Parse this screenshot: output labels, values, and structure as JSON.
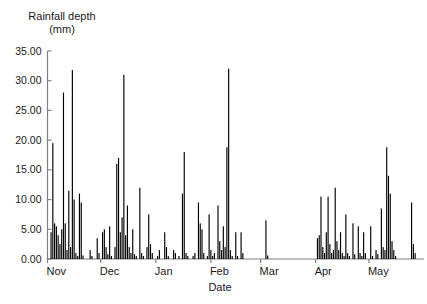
{
  "chart_data": {
    "type": "bar",
    "title": "",
    "ylabel": "Rainfall depth\n(mm)",
    "ylabel_line1": "Rainfall depth",
    "ylabel_line2": "(mm)",
    "xlabel": "Date",
    "ylim": [
      0,
      35
    ],
    "ytick_labels": [
      "0.00",
      "5.00",
      "10.00",
      "15.00",
      "20.00",
      "25.00",
      "30.00",
      "35.00"
    ],
    "ytick_values": [
      0,
      5,
      10,
      15,
      20,
      25,
      30,
      35
    ],
    "xtick_labels": [
      "Nov",
      "Dec",
      "Jan",
      "Feb",
      "Mar",
      "Apr",
      "May"
    ],
    "xtick_positions": [
      0,
      30,
      61,
      92,
      120,
      151,
      181
    ],
    "grid": false,
    "legend": null,
    "bar_color": "#000000",
    "axis_color": "#808080",
    "x_unit": "day",
    "x_range": [
      0,
      212
    ],
    "values": [
      {
        "x": 1,
        "v": 0.0
      },
      {
        "x": 2,
        "v": 4.5
      },
      {
        "x": 3,
        "v": 19.5
      },
      {
        "x": 4,
        "v": 6.0
      },
      {
        "x": 5,
        "v": 5.5
      },
      {
        "x": 6,
        "v": 4.0
      },
      {
        "x": 7,
        "v": 2.5
      },
      {
        "x": 8,
        "v": 5.0
      },
      {
        "x": 9,
        "v": 28.0
      },
      {
        "x": 10,
        "v": 6.0
      },
      {
        "x": 11,
        "v": 1.5
      },
      {
        "x": 12,
        "v": 11.5
      },
      {
        "x": 13,
        "v": 2.0
      },
      {
        "x": 14,
        "v": 31.8
      },
      {
        "x": 15,
        "v": 10.0
      },
      {
        "x": 16,
        "v": 1.0
      },
      {
        "x": 17,
        "v": 0.5
      },
      {
        "x": 18,
        "v": 11.0
      },
      {
        "x": 19,
        "v": 9.5
      },
      {
        "x": 20,
        "v": 0.6
      },
      {
        "x": 21,
        "v": 0.0
      },
      {
        "x": 22,
        "v": 0.0
      },
      {
        "x": 23,
        "v": 0.0
      },
      {
        "x": 24,
        "v": 1.5
      },
      {
        "x": 25,
        "v": 0.5
      },
      {
        "x": 26,
        "v": 0.0
      },
      {
        "x": 27,
        "v": 0.0
      },
      {
        "x": 28,
        "v": 3.5
      },
      {
        "x": 29,
        "v": 1.0
      },
      {
        "x": 30,
        "v": 0.0
      },
      {
        "x": 31,
        "v": 4.5
      },
      {
        "x": 32,
        "v": 5.0
      },
      {
        "x": 33,
        "v": 2.0
      },
      {
        "x": 34,
        "v": 0.8
      },
      {
        "x": 35,
        "v": 5.5
      },
      {
        "x": 36,
        "v": 0.5
      },
      {
        "x": 37,
        "v": 0.0
      },
      {
        "x": 38,
        "v": 2.0
      },
      {
        "x": 39,
        "v": 16.0
      },
      {
        "x": 40,
        "v": 17.0
      },
      {
        "x": 41,
        "v": 4.5
      },
      {
        "x": 42,
        "v": 7.0
      },
      {
        "x": 43,
        "v": 31.0
      },
      {
        "x": 44,
        "v": 4.0
      },
      {
        "x": 45,
        "v": 9.0
      },
      {
        "x": 46,
        "v": 2.0
      },
      {
        "x": 47,
        "v": 1.0
      },
      {
        "x": 48,
        "v": 5.0
      },
      {
        "x": 49,
        "v": 0.8
      },
      {
        "x": 50,
        "v": 0.5
      },
      {
        "x": 51,
        "v": 0.0
      },
      {
        "x": 52,
        "v": 12.0
      },
      {
        "x": 53,
        "v": 1.0
      },
      {
        "x": 54,
        "v": 0.5
      },
      {
        "x": 55,
        "v": 0.0
      },
      {
        "x": 56,
        "v": 2.0
      },
      {
        "x": 57,
        "v": 7.5
      },
      {
        "x": 58,
        "v": 2.5
      },
      {
        "x": 59,
        "v": 1.0
      },
      {
        "x": 60,
        "v": 0.0
      },
      {
        "x": 61,
        "v": 0.0
      },
      {
        "x": 62,
        "v": 0.5
      },
      {
        "x": 63,
        "v": 1.5
      },
      {
        "x": 64,
        "v": 0.0
      },
      {
        "x": 65,
        "v": 0.0
      },
      {
        "x": 66,
        "v": 4.5
      },
      {
        "x": 67,
        "v": 2.0
      },
      {
        "x": 68,
        "v": 0.5
      },
      {
        "x": 69,
        "v": 0.0
      },
      {
        "x": 70,
        "v": 0.0
      },
      {
        "x": 71,
        "v": 1.5
      },
      {
        "x": 72,
        "v": 1.0
      },
      {
        "x": 73,
        "v": 0.0
      },
      {
        "x": 74,
        "v": 0.5
      },
      {
        "x": 75,
        "v": 0.0
      },
      {
        "x": 76,
        "v": 11.0
      },
      {
        "x": 77,
        "v": 18.0
      },
      {
        "x": 78,
        "v": 1.0
      },
      {
        "x": 79,
        "v": 0.5
      },
      {
        "x": 80,
        "v": 0.0
      },
      {
        "x": 81,
        "v": 0.0
      },
      {
        "x": 82,
        "v": 0.5
      },
      {
        "x": 83,
        "v": 1.0
      },
      {
        "x": 84,
        "v": 0.0
      },
      {
        "x": 85,
        "v": 9.5
      },
      {
        "x": 86,
        "v": 6.0
      },
      {
        "x": 87,
        "v": 5.0
      },
      {
        "x": 88,
        "v": 1.0
      },
      {
        "x": 89,
        "v": 0.0
      },
      {
        "x": 90,
        "v": 0.5
      },
      {
        "x": 91,
        "v": 7.5
      },
      {
        "x": 92,
        "v": 1.5
      },
      {
        "x": 93,
        "v": 0.5
      },
      {
        "x": 94,
        "v": 1.0
      },
      {
        "x": 95,
        "v": 0.0
      },
      {
        "x": 96,
        "v": 9.0
      },
      {
        "x": 97,
        "v": 3.0
      },
      {
        "x": 98,
        "v": 1.5
      },
      {
        "x": 99,
        "v": 5.5
      },
      {
        "x": 100,
        "v": 2.0
      },
      {
        "x": 101,
        "v": 18.8
      },
      {
        "x": 102,
        "v": 32.0
      },
      {
        "x": 103,
        "v": 1.5
      },
      {
        "x": 104,
        "v": 0.5
      },
      {
        "x": 105,
        "v": 0.0
      },
      {
        "x": 106,
        "v": 4.5
      },
      {
        "x": 107,
        "v": 0.5
      },
      {
        "x": 108,
        "v": 0.0
      },
      {
        "x": 109,
        "v": 4.5
      },
      {
        "x": 110,
        "v": 1.0
      },
      {
        "x": 111,
        "v": 0.0
      },
      {
        "x": 112,
        "v": 0.0
      },
      {
        "x": 113,
        "v": 0.0
      },
      {
        "x": 114,
        "v": 0.0
      },
      {
        "x": 115,
        "v": 0.0
      },
      {
        "x": 116,
        "v": 0.0
      },
      {
        "x": 117,
        "v": 0.0
      },
      {
        "x": 118,
        "v": 0.0
      },
      {
        "x": 119,
        "v": 0.0
      },
      {
        "x": 120,
        "v": 0.0
      },
      {
        "x": 121,
        "v": 0.0
      },
      {
        "x": 122,
        "v": 0.0
      },
      {
        "x": 123,
        "v": 6.5
      },
      {
        "x": 124,
        "v": 0.6
      },
      {
        "x": 125,
        "v": 0.0
      },
      {
        "x": 126,
        "v": 0.0
      },
      {
        "x": 127,
        "v": 0.0
      },
      {
        "x": 128,
        "v": 0.0
      },
      {
        "x": 129,
        "v": 0.0
      },
      {
        "x": 130,
        "v": 0.0
      },
      {
        "x": 131,
        "v": 0.0
      },
      {
        "x": 132,
        "v": 0.0
      },
      {
        "x": 133,
        "v": 0.0
      },
      {
        "x": 134,
        "v": 0.0
      },
      {
        "x": 135,
        "v": 0.0
      },
      {
        "x": 136,
        "v": 0.0
      },
      {
        "x": 137,
        "v": 0.0
      },
      {
        "x": 138,
        "v": 0.0
      },
      {
        "x": 139,
        "v": 0.0
      },
      {
        "x": 140,
        "v": 0.0
      },
      {
        "x": 141,
        "v": 0.0
      },
      {
        "x": 142,
        "v": 0.0
      },
      {
        "x": 143,
        "v": 0.0
      },
      {
        "x": 144,
        "v": 0.0
      },
      {
        "x": 145,
        "v": 0.0
      },
      {
        "x": 146,
        "v": 0.0
      },
      {
        "x": 147,
        "v": 0.0
      },
      {
        "x": 148,
        "v": 0.0
      },
      {
        "x": 149,
        "v": 0.0
      },
      {
        "x": 150,
        "v": 0.0
      },
      {
        "x": 151,
        "v": 0.0
      },
      {
        "x": 152,
        "v": 3.5
      },
      {
        "x": 153,
        "v": 4.0
      },
      {
        "x": 154,
        "v": 10.5
      },
      {
        "x": 155,
        "v": 2.0
      },
      {
        "x": 156,
        "v": 1.0
      },
      {
        "x": 157,
        "v": 4.5
      },
      {
        "x": 158,
        "v": 10.5
      },
      {
        "x": 159,
        "v": 2.5
      },
      {
        "x": 160,
        "v": 1.0
      },
      {
        "x": 161,
        "v": 1.5
      },
      {
        "x": 162,
        "v": 12.0
      },
      {
        "x": 163,
        "v": 3.0
      },
      {
        "x": 164,
        "v": 1.5
      },
      {
        "x": 165,
        "v": 4.5
      },
      {
        "x": 166,
        "v": 1.0
      },
      {
        "x": 167,
        "v": 0.5
      },
      {
        "x": 168,
        "v": 7.5
      },
      {
        "x": 169,
        "v": 1.0
      },
      {
        "x": 170,
        "v": 0.5
      },
      {
        "x": 171,
        "v": 0.0
      },
      {
        "x": 172,
        "v": 6.0
      },
      {
        "x": 173,
        "v": 0.8
      },
      {
        "x": 174,
        "v": 0.0
      },
      {
        "x": 175,
        "v": 5.5
      },
      {
        "x": 176,
        "v": 1.0
      },
      {
        "x": 177,
        "v": 0.5
      },
      {
        "x": 178,
        "v": 4.5
      },
      {
        "x": 179,
        "v": 1.0
      },
      {
        "x": 180,
        "v": 0.0
      },
      {
        "x": 181,
        "v": 0.0
      },
      {
        "x": 182,
        "v": 5.5
      },
      {
        "x": 183,
        "v": 0.5
      },
      {
        "x": 184,
        "v": 0.0
      },
      {
        "x": 185,
        "v": 1.5
      },
      {
        "x": 186,
        "v": 0.8
      },
      {
        "x": 187,
        "v": 0.0
      },
      {
        "x": 188,
        "v": 8.5
      },
      {
        "x": 189,
        "v": 2.0
      },
      {
        "x": 190,
        "v": 1.5
      },
      {
        "x": 191,
        "v": 18.8
      },
      {
        "x": 192,
        "v": 14.0
      },
      {
        "x": 193,
        "v": 11.0
      },
      {
        "x": 194,
        "v": 3.0
      },
      {
        "x": 195,
        "v": 1.5
      },
      {
        "x": 196,
        "v": 0.5
      },
      {
        "x": 197,
        "v": 0.0
      },
      {
        "x": 198,
        "v": 0.0
      },
      {
        "x": 199,
        "v": 0.0
      },
      {
        "x": 200,
        "v": 0.0
      },
      {
        "x": 201,
        "v": 0.0
      },
      {
        "x": 202,
        "v": 0.0
      },
      {
        "x": 203,
        "v": 0.0
      },
      {
        "x": 204,
        "v": 0.0
      },
      {
        "x": 205,
        "v": 9.5
      },
      {
        "x": 206,
        "v": 2.5
      },
      {
        "x": 207,
        "v": 1.0
      },
      {
        "x": 208,
        "v": 0.0
      },
      {
        "x": 209,
        "v": 0.0
      },
      {
        "x": 210,
        "v": 0.0
      },
      {
        "x": 211,
        "v": 0.0
      },
      {
        "x": 212,
        "v": 0.0
      }
    ]
  }
}
